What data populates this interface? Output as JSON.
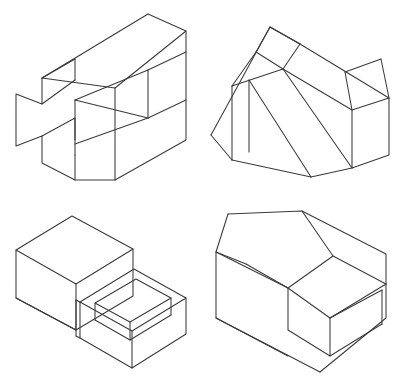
{
  "sheet": {
    "title": "Isometric Pictorial Drawings",
    "width": 395,
    "height": 386,
    "background_color": "#ffffff",
    "line_color": "#3a3a3c",
    "line_width": 1.05,
    "figure_count": 4,
    "layout": "2x2 grid of unlabeled isometric line drawings"
  },
  "figures": [
    {
      "id": "figure-top-left",
      "position": "top-left",
      "name": "cross-slot-block-with-v-groove",
      "description": "Rectangular block in isometric view; the left end face is a cross / plus shaped profile with a notch cut top and bottom, and a triangular V shaped groove is cut into the front face.",
      "bounds": {
        "x": 8,
        "y": 14,
        "width": 178,
        "height": 168
      },
      "visible_faces": [
        "top",
        "front",
        "right-end",
        "groove-left",
        "groove-right",
        "notch-floor"
      ],
      "edges": [
        {
          "name": "top-face-outline",
          "points": "42,78 40,132 75,155 75,130 115,155 115,180 186,140 186,31 148,14 42,78"
        },
        {
          "name": "front-profile",
          "points": "42,78 75,59 75,80 115,57 115,88 148,70"
        },
        {
          "name": "v-groove",
          "points": "75,100 148,70 148,118 75,144"
        }
      ],
      "line_color": "#3a3a3c"
    },
    {
      "id": "figure-top-right",
      "position": "top-right",
      "name": "double-wedge-inclined-block",
      "description": "Block with a large inclined wedge surface rising from a front point, plus a narrow raised rib running up the slope; right end is a vertical rectangular face.",
      "bounds": {
        "x": 211,
        "y": 16,
        "width": 170,
        "height": 165
      },
      "visible_faces": [
        "slope-large",
        "slope-rib",
        "left-triangle",
        "right-end",
        "top-small",
        "bottom"
      ],
      "edges": [
        {
          "name": "left-triangle",
          "points": "211,135 268,28 295,47 232,160"
        },
        {
          "name": "slope-face",
          "points": "268,28 380,97 310,175 232,160"
        },
        {
          "name": "right-end",
          "points": "340,45 382,60 382,120 340,135"
        }
      ],
      "line_color": "#3a3a3c"
    },
    {
      "id": "figure-bottom-left",
      "position": "bottom-left",
      "name": "stepped-block-with-open-tray",
      "description": "Two stacked rectangular volumes forming a step; the lower right volume is an open topped tray showing its inner side walls and inner floor.",
      "bounds": {
        "x": 8,
        "y": 212,
        "width": 178,
        "height": 166
      },
      "visible_faces": [
        "upper-top",
        "upper-front",
        "upper-left",
        "tray-rim",
        "tray-inner-walls",
        "tray-inner-floor",
        "tray-front"
      ],
      "edges": [
        {
          "name": "upper-box",
          "points": "16,250 72,216 132,248 132,295 76,330 16,298"
        },
        {
          "name": "tray-outer",
          "points": "80,300 134,268 186,298 186,330 132,362 80,334"
        },
        {
          "name": "tray-inner",
          "points": "96,302 136,279 170,298 136,320"
        }
      ],
      "line_color": "#3a3a3c"
    },
    {
      "id": "figure-bottom-right",
      "position": "bottom-right",
      "name": "block-with-chamfer-and-inner-step",
      "description": "Large rectangular block with a chamfered corner on the top left and a raised rectangular step set into the lower top surface.",
      "bounds": {
        "x": 212,
        "y": 211,
        "width": 175,
        "height": 167
      },
      "visible_faces": [
        "top-upper",
        "chamfer",
        "left-end",
        "front",
        "step-top",
        "step-front",
        "step-side",
        "lower-top"
      ],
      "edges": [
        {
          "name": "outer-body",
          "points": "216,252 228,214 302,211 386,254 386,318 320,372 216,318"
        },
        {
          "name": "chamfer",
          "points": "228,214 302,211 332,256 288,288"
        },
        {
          "name": "inner-step",
          "points": "288,288 330,262 382,292 330,330"
        }
      ],
      "line_color": "#3a3a3c"
    }
  ]
}
